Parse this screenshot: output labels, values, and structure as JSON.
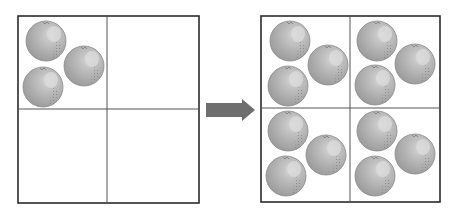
{
  "diagram": {
    "colors": {
      "border": "#2b2b2b",
      "grid_line": "#555555",
      "arrow": "#6e6e6e",
      "orange_fill": "#a9a9a9",
      "orange_shade": "#8f8f8f",
      "orange_highlight": "#d2d2d2",
      "orange_outline": "#8a8a8a"
    },
    "left_grid": {
      "rows": 2,
      "cols": 2,
      "cells": [
        {
          "position": "top-left",
          "orange_count": 3
        },
        {
          "position": "top-right",
          "orange_count": 0
        },
        {
          "position": "bottom-left",
          "orange_count": 0
        },
        {
          "position": "bottom-right",
          "orange_count": 0
        }
      ]
    },
    "arrow": {
      "direction": "right",
      "icon": "right-arrow-icon"
    },
    "right_grid": {
      "rows": 2,
      "cols": 2,
      "cells": [
        {
          "position": "top-left",
          "orange_count": 3
        },
        {
          "position": "top-right",
          "orange_count": 3
        },
        {
          "position": "bottom-left",
          "orange_count": 3
        },
        {
          "position": "bottom-right",
          "orange_count": 3
        }
      ]
    }
  }
}
